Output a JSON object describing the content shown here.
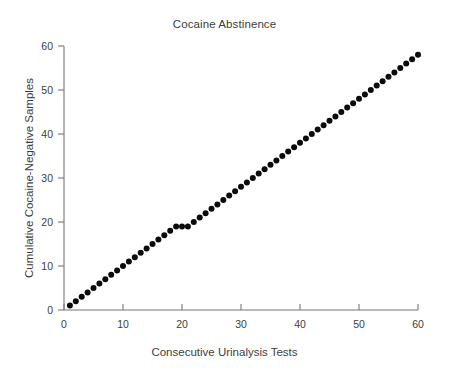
{
  "chart_data": {
    "type": "scatter",
    "title": "Cocaine Abstinence",
    "xlabel": "Consecutive Urinalysis Tests",
    "ylabel": "Cumulative Cocaine-Negative Samples",
    "xlim": [
      0,
      60
    ],
    "ylim": [
      0,
      60
    ],
    "xticks": [
      0,
      10,
      20,
      30,
      40,
      50,
      60
    ],
    "yticks": [
      0,
      10,
      20,
      30,
      40,
      50,
      60
    ],
    "xticklabels": [
      "0",
      "10",
      "20",
      "30",
      "40",
      "50",
      "60"
    ],
    "yticklabels": [
      "0",
      "10",
      "20",
      "30",
      "40",
      "50",
      "60"
    ],
    "grid": false,
    "legend": null,
    "marker": "filled-circle",
    "marker_color": "#0b0b0b",
    "marker_size_px": 6,
    "series": [
      {
        "name": "Cumulative cocaine-negative samples",
        "x": [
          1,
          2,
          3,
          4,
          5,
          6,
          7,
          8,
          9,
          10,
          11,
          12,
          13,
          14,
          15,
          16,
          17,
          18,
          19,
          20,
          21,
          22,
          23,
          24,
          25,
          26,
          27,
          28,
          29,
          30,
          31,
          32,
          33,
          34,
          35,
          36,
          37,
          38,
          39,
          40,
          41,
          42,
          43,
          44,
          45,
          46,
          47,
          48,
          49,
          50,
          51,
          52,
          53,
          54,
          55,
          56,
          57,
          58,
          59,
          60
        ],
        "y": [
          1,
          2,
          3,
          4,
          5,
          6,
          7,
          8,
          9,
          10,
          11,
          12,
          13,
          14,
          15,
          16,
          17,
          18,
          19,
          19,
          19,
          20,
          21,
          22,
          23,
          24,
          25,
          26,
          27,
          28,
          29,
          30,
          31,
          32,
          33,
          34,
          35,
          36,
          37,
          38,
          39,
          40,
          41,
          42,
          43,
          44,
          45,
          46,
          47,
          48,
          49,
          50,
          51,
          52,
          53,
          54,
          55,
          56,
          57,
          58
        ]
      }
    ],
    "annotations": [
      "Plateau at cumulative value 19 across tests 19-21 (two positive samples)"
    ]
  },
  "colors": {
    "background": "#ffffff",
    "axis": "#777777",
    "text": "#3d3d3d",
    "marker": "#0b0b0b"
  }
}
